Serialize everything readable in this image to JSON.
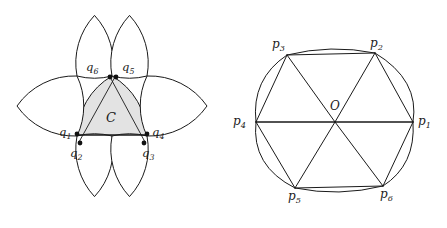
{
  "figure": {
    "type": "geometry-diagram",
    "stroke_color": "#1a1a1a",
    "fill_color": "#e0e0e0",
    "background": "#ffffff"
  },
  "left_figure": {
    "name": "reuleaux-packing",
    "center_label": "C",
    "vertex_labels": [
      {
        "id": "q1",
        "base": "q",
        "sub": "1"
      },
      {
        "id": "q2",
        "base": "q",
        "sub": "2"
      },
      {
        "id": "q3",
        "base": "q",
        "sub": "3"
      },
      {
        "id": "q4",
        "base": "q",
        "sub": "4"
      },
      {
        "id": "q5",
        "base": "q",
        "sub": "5"
      },
      {
        "id": "q6",
        "base": "q",
        "sub": "6"
      }
    ],
    "petal_count": 6
  },
  "right_figure": {
    "name": "curved-hexagon",
    "center_label": "O",
    "vertex_labels": [
      {
        "id": "p1",
        "base": "p",
        "sub": "1"
      },
      {
        "id": "p2",
        "base": "p",
        "sub": "2"
      },
      {
        "id": "p3",
        "base": "p",
        "sub": "3"
      },
      {
        "id": "p4",
        "base": "p",
        "sub": "4"
      },
      {
        "id": "p5",
        "base": "p",
        "sub": "5"
      },
      {
        "id": "p6",
        "base": "p",
        "sub": "6"
      }
    ],
    "radii_count": 6
  }
}
